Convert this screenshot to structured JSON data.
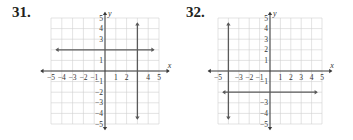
{
  "chart_data": [
    {
      "type": "line",
      "problem_number": "31.",
      "title": "",
      "xlabel": "x",
      "ylabel": "y",
      "xlim": [
        -5,
        5
      ],
      "ylim": [
        -5,
        5
      ],
      "grid": true,
      "x_tick_labels": [
        "−5",
        "−4",
        "−3",
        "−2",
        "−1",
        "1",
        "2",
        "4",
        "5"
      ],
      "x_tick_values": [
        -5,
        -4,
        -3,
        -2,
        -1,
        1,
        2,
        4,
        5
      ],
      "y_tick_labels": [
        "5",
        "4",
        "3",
        "1",
        "−1",
        "−2",
        "−3",
        "−4",
        "−5"
      ],
      "y_tick_values": [
        5,
        4,
        3,
        1,
        -1,
        -2,
        -3,
        -4,
        -5
      ],
      "series": [
        {
          "name": "y = 2",
          "kind": "horizontal",
          "value": 2,
          "range": [
            -4.5,
            4.5
          ],
          "arrows": "both"
        },
        {
          "name": "x = 3",
          "kind": "vertical",
          "value": 3,
          "range": [
            -4.5,
            4.5
          ],
          "arrows": "both"
        }
      ],
      "colors": {
        "line": "#5a5a5a",
        "axis": "#3a3a3a",
        "grid": "#d0d0d0"
      }
    },
    {
      "type": "line",
      "problem_number": "32.",
      "title": "",
      "xlabel": "x",
      "ylabel": "y",
      "xlim": [
        -5,
        5
      ],
      "ylim": [
        -5,
        5
      ],
      "grid": true,
      "x_tick_labels": [
        "−5",
        "−3",
        "−2",
        "−1",
        "1",
        "2",
        "3",
        "4",
        "5"
      ],
      "x_tick_values": [
        -5,
        -3,
        -2,
        -1,
        1,
        2,
        3,
        4,
        5
      ],
      "y_tick_labels": [
        "5",
        "4",
        "3",
        "2",
        "1",
        "−1",
        "−3",
        "−4",
        "−5"
      ],
      "y_tick_values": [
        5,
        4,
        3,
        2,
        1,
        -1,
        -3,
        -4,
        -5
      ],
      "series": [
        {
          "name": "x = -4",
          "kind": "vertical",
          "value": -4,
          "range": [
            -4.5,
            4.5
          ],
          "arrows": "both"
        },
        {
          "name": "y = -2",
          "kind": "horizontal",
          "value": -2,
          "range": [
            -4.5,
            4.5
          ],
          "arrows": "both"
        }
      ],
      "colors": {
        "line": "#5a5a5a",
        "axis": "#3a3a3a",
        "grid": "#d0d0d0"
      }
    }
  ]
}
